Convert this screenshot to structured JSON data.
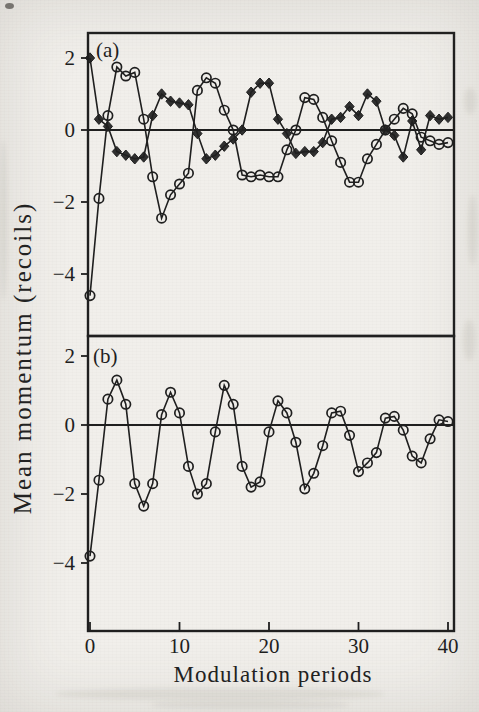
{
  "page": {
    "background": "#f1efeb",
    "ink": "#1f1f1f"
  },
  "figure": {
    "y_axis_label": "Mean momentum (recoils)",
    "x_axis_label": "Modulation periods"
  },
  "chart_data": [
    {
      "type": "line",
      "panel_label": "(a)",
      "x_label": "Modulation periods",
      "y_label": "Mean momentum (recoils)",
      "x": [
        0,
        1,
        2,
        3,
        4,
        5,
        6,
        7,
        8,
        9,
        10,
        11,
        12,
        13,
        14,
        15,
        16,
        17,
        18,
        19,
        20,
        21,
        22,
        23,
        24,
        25,
        26,
        27,
        28,
        29,
        30,
        31,
        32,
        33,
        34,
        35,
        36,
        37,
        38,
        39,
        40
      ],
      "xlim": [
        0,
        40
      ],
      "ylim": [
        -5.7,
        2.7
      ],
      "xticks": [
        0,
        10,
        20,
        30,
        40
      ],
      "xtick_labels": [
        "0",
        "10",
        "20",
        "30",
        "40"
      ],
      "yticks": [
        2,
        0,
        -2,
        -4
      ],
      "ytick_labels": [
        "2",
        "0",
        "−2",
        "−4"
      ],
      "grid": false,
      "legend": null,
      "series": [
        {
          "name": "diamond-series",
          "marker": "diamond",
          "values": [
            2.0,
            0.3,
            0.1,
            -0.6,
            -0.7,
            -0.8,
            -0.75,
            0.4,
            1.0,
            0.8,
            0.75,
            0.7,
            -0.1,
            -0.8,
            -0.7,
            -0.45,
            -0.25,
            0.0,
            1.05,
            1.3,
            1.3,
            0.3,
            -0.1,
            -0.65,
            -0.6,
            -0.6,
            -0.35,
            0.3,
            0.35,
            0.65,
            0.4,
            1.0,
            0.8,
            0.0,
            -0.15,
            -0.75,
            0.25,
            -0.55,
            0.4,
            0.3,
            0.35
          ]
        },
        {
          "name": "circle-series",
          "marker": "circle",
          "values": [
            -4.6,
            -1.9,
            0.4,
            1.75,
            1.5,
            1.6,
            0.3,
            -1.3,
            -2.45,
            -1.8,
            -1.5,
            -1.2,
            1.1,
            1.45,
            1.3,
            0.55,
            0.0,
            -1.25,
            -1.3,
            -1.25,
            -1.3,
            -1.3,
            -0.55,
            0.0,
            0.9,
            0.85,
            0.35,
            -0.3,
            -0.9,
            -1.45,
            -1.45,
            -0.8,
            -0.4,
            0.0,
            0.3,
            0.6,
            0.45,
            -0.2,
            -0.3,
            -0.4,
            -0.35
          ]
        }
      ]
    },
    {
      "type": "line",
      "panel_label": "(b)",
      "x_label": "Modulation periods",
      "y_label": "Mean momentum (recoils)",
      "x": [
        0,
        1,
        2,
        3,
        4,
        5,
        6,
        7,
        8,
        9,
        10,
        11,
        12,
        13,
        14,
        15,
        16,
        17,
        18,
        19,
        20,
        21,
        22,
        23,
        24,
        25,
        26,
        27,
        28,
        29,
        30,
        31,
        32,
        33,
        34,
        35,
        36,
        37,
        38,
        39,
        40
      ],
      "xlim": [
        0,
        40
      ],
      "ylim": [
        -5.9,
        2.5
      ],
      "xticks": [
        0,
        10,
        20,
        30,
        40
      ],
      "xtick_labels": [
        "0",
        "10",
        "20",
        "30",
        "40"
      ],
      "yticks": [
        2,
        0,
        -2,
        -4
      ],
      "ytick_labels": [
        "2",
        "0",
        "−2",
        "−4"
      ],
      "grid": false,
      "legend": null,
      "series": [
        {
          "name": "circle-series",
          "marker": "circle",
          "values": [
            -3.8,
            -1.6,
            0.75,
            1.3,
            0.6,
            -1.7,
            -2.35,
            -1.7,
            0.3,
            0.95,
            0.35,
            -1.2,
            -2.0,
            -1.7,
            -0.2,
            1.15,
            0.6,
            -1.2,
            -1.8,
            -1.65,
            -0.2,
            0.7,
            0.35,
            -0.5,
            -1.85,
            -1.4,
            -0.6,
            0.35,
            0.4,
            -0.3,
            -1.35,
            -1.1,
            -0.8,
            0.2,
            0.25,
            -0.15,
            -0.9,
            -1.1,
            -0.4,
            0.15,
            0.1
          ]
        }
      ]
    }
  ]
}
